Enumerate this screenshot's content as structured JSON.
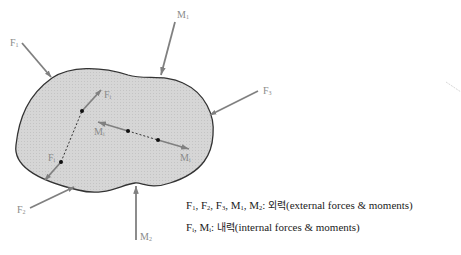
{
  "diagram": {
    "type": "free-body-diagram",
    "body_fill": "#d4d4d4",
    "body_outline": "#333333",
    "arrow_color": "#808080",
    "label_color": "#8a8a8a",
    "external_loads": [
      {
        "id": "F1",
        "base": "F",
        "sub": "1",
        "direction": "down-right"
      },
      {
        "id": "M1",
        "base": "M",
        "sub": "1",
        "direction": "down-left"
      },
      {
        "id": "F3",
        "base": "F",
        "sub": "3",
        "direction": "down-left"
      },
      {
        "id": "F2",
        "base": "F",
        "sub": "2",
        "direction": "up-right"
      },
      {
        "id": "M2",
        "base": "M",
        "sub": "2",
        "direction": "up"
      }
    ],
    "internal_loads": [
      {
        "id": "Fi_up",
        "base": "F",
        "sub": "i",
        "direction": "up-right"
      },
      {
        "id": "Fi_down",
        "base": "F",
        "sub": "i",
        "direction": "down-left"
      },
      {
        "id": "Mi_left",
        "base": "M",
        "sub": "i",
        "direction": "left"
      },
      {
        "id": "Mi_right",
        "base": "M",
        "sub": "i",
        "direction": "right"
      }
    ]
  },
  "labels": {
    "F1": {
      "base": "F",
      "sub": "1"
    },
    "M1": {
      "base": "M",
      "sub": "1"
    },
    "F3": {
      "base": "F",
      "sub": "3"
    },
    "F2": {
      "base": "F",
      "sub": "2"
    },
    "M2": {
      "base": "M",
      "sub": "2"
    },
    "Fi_top": {
      "base": "F",
      "sub": "i"
    },
    "Fi_bottom": {
      "base": "F",
      "sub": "i"
    },
    "Mi_left": {
      "base": "M",
      "sub": "i"
    },
    "Mi_right": {
      "base": "M",
      "sub": "i"
    }
  },
  "legend": {
    "line1": {
      "F1": {
        "base": "F",
        "sub": "1"
      },
      "sep1": ", ",
      "F2": {
        "base": "F",
        "sub": "2"
      },
      "sep2": ", ",
      "F3": {
        "base": "F",
        "sub": "3"
      },
      "sep3": ", ",
      "M1": {
        "base": "M",
        "sub": "1"
      },
      "sep4": ", ",
      "M2": {
        "base": "M",
        "sub": "2"
      },
      "colon": ": ",
      "korean": "외력",
      "english": "(external forces & moments)"
    },
    "line2": {
      "Fi": {
        "base": "F",
        "sub": "i"
      },
      "sep1": ", ",
      "Mi": {
        "base": "M",
        "sub": "i"
      },
      "colon": ": ",
      "korean": "내력",
      "english": "(internal forces & moments)"
    }
  }
}
